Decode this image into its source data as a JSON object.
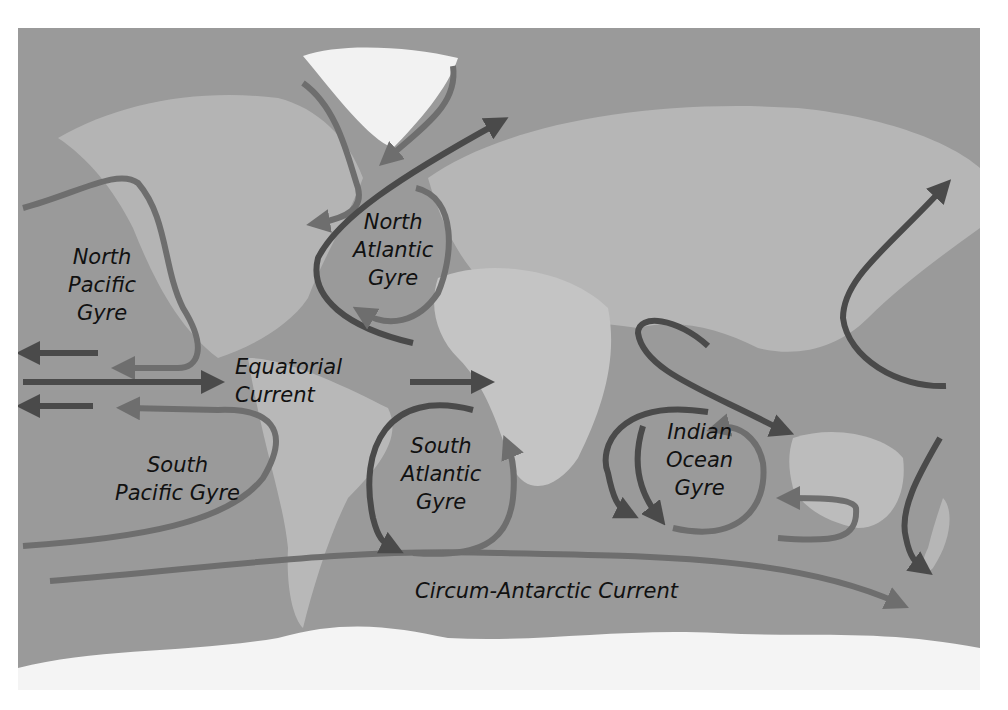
{
  "map": {
    "title": "Ocean Gyres and Currents",
    "colors": {
      "ocean": "#9a9a9a",
      "land": "#b8b8b8",
      "ice": "#f4f4f4",
      "warm_arrow": "#6e6e6e",
      "cold_arrow": "#4a4a4a",
      "label_text": "#111111"
    },
    "labels": {
      "north_pacific": [
        "North",
        "Pacific",
        "Gyre"
      ],
      "north_atlantic": [
        "North",
        "Atlantic",
        "Gyre"
      ],
      "equatorial": [
        "Equatorial",
        "Current"
      ],
      "south_pacific": [
        "South",
        "Pacific Gyre"
      ],
      "south_atlantic": [
        "South",
        "Atlantic",
        "Gyre"
      ],
      "indian_ocean": [
        "Indian",
        "Ocean",
        "Gyre"
      ],
      "circum_antarctic": "Circum-Antarctic Current"
    }
  }
}
